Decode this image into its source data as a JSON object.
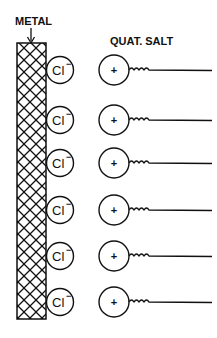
{
  "labels": {
    "metal": "METAL",
    "quat_salt": "QUAT. SALT"
  },
  "anion": {
    "symbol": "Cl",
    "charge": "−"
  },
  "cation": {
    "symbol": "+"
  },
  "rows": [
    {
      "y": 70
    },
    {
      "y": 120
    },
    {
      "y": 163
    },
    {
      "y": 210
    },
    {
      "y": 256
    },
    {
      "y": 302
    }
  ],
  "colors": {
    "ink": "#111111",
    "background": "#ffffff"
  }
}
